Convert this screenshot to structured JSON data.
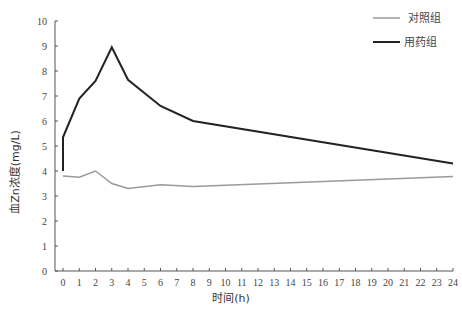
{
  "chart_data": {
    "type": "line",
    "title": "",
    "xlabel": "时间(h)",
    "ylabel": "血Zn浓度(mg/L)",
    "xlim": [
      0,
      24
    ],
    "ylim": [
      0,
      10
    ],
    "x_ticks": [
      0,
      1,
      2,
      3,
      4,
      5,
      6,
      7,
      8,
      9,
      10,
      11,
      12,
      13,
      14,
      15,
      16,
      17,
      18,
      19,
      20,
      21,
      22,
      23,
      24
    ],
    "y_ticks": [
      0,
      1,
      2,
      3,
      4,
      5,
      6,
      7,
      8,
      9,
      10
    ],
    "grid": false,
    "legend_position": "top-right",
    "series": [
      {
        "name": "对照组",
        "color": "#9a9a9a",
        "x": [
          0,
          1,
          2,
          3,
          4,
          6,
          8,
          24
        ],
        "values": [
          3.8,
          3.75,
          4.0,
          3.5,
          3.3,
          3.45,
          3.38,
          3.78
        ]
      },
      {
        "name": "用药组",
        "color": "#222222",
        "x": [
          0,
          0,
          1,
          2,
          3,
          4,
          6,
          8,
          24
        ],
        "values": [
          4.0,
          5.35,
          6.9,
          7.6,
          8.95,
          7.65,
          6.6,
          6.0,
          4.3
        ]
      }
    ]
  },
  "legend": {
    "items": [
      {
        "label": "对照组",
        "color": "#9a9a9a"
      },
      {
        "label": "用药组",
        "color": "#222222"
      }
    ]
  },
  "axes": {
    "x_title": "时间(h)",
    "y_title": "血Zn浓度(mg/L)"
  }
}
